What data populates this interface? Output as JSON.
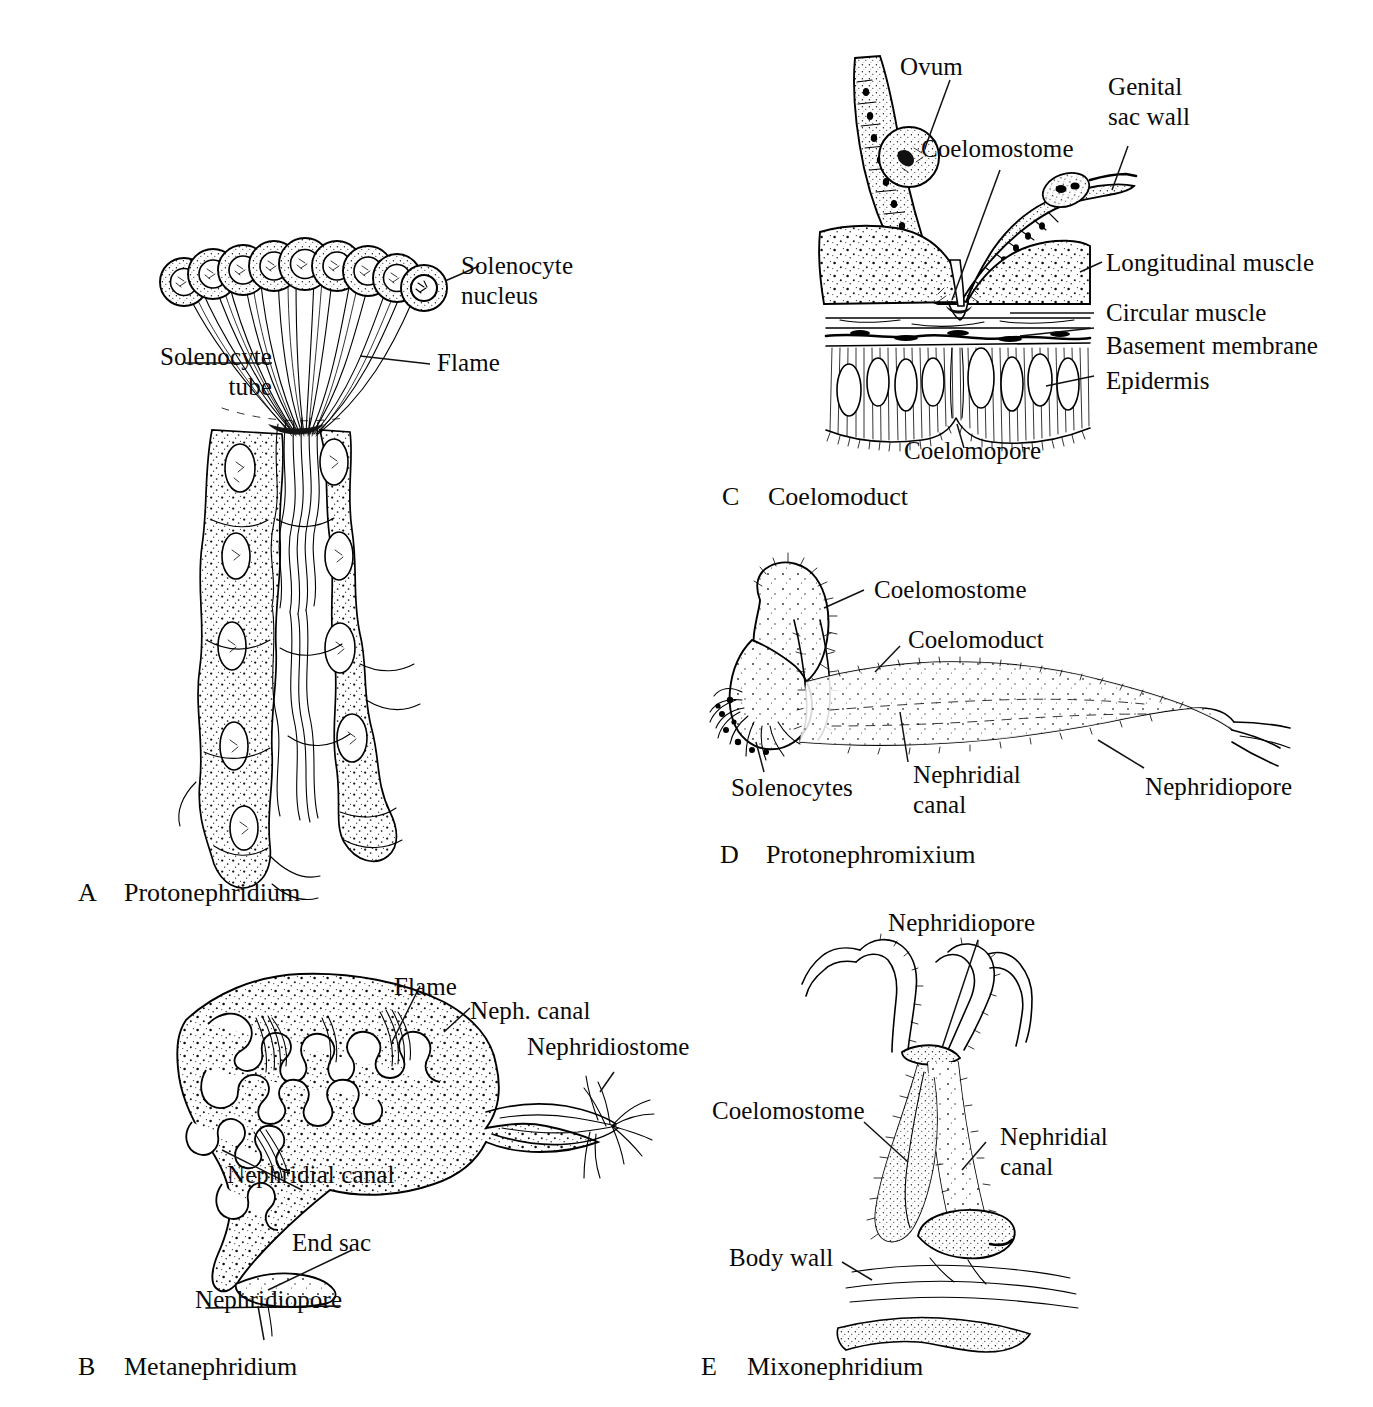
{
  "figure": {
    "background_color": "#ffffff",
    "ink_color": "#000000",
    "style": "black and white line drawing with stipple shading"
  },
  "panels": [
    {
      "id": "A",
      "letter": "A",
      "caption": "Protonephridium",
      "labels": [
        {
          "key": "solenocyte_nucleus",
          "text": "Solenocyte\nnucleus"
        },
        {
          "key": "solenocyte_tube",
          "text": "Solenocyte\ntube"
        },
        {
          "key": "flame",
          "text": "Flame"
        }
      ]
    },
    {
      "id": "B",
      "letter": "B",
      "caption": "Metanephridium",
      "labels": [
        {
          "key": "flame",
          "text": "Flame"
        },
        {
          "key": "neph_canal",
          "text": "Neph. canal"
        },
        {
          "key": "nephridiostome",
          "text": "Nephridiostome"
        },
        {
          "key": "nephridial_canal",
          "text": "Nephridial canal"
        },
        {
          "key": "end_sac",
          "text": "End sac"
        },
        {
          "key": "nephridiopore",
          "text": "Nephridiopore"
        }
      ]
    },
    {
      "id": "C",
      "letter": "C",
      "caption": "Coelomoduct",
      "labels": [
        {
          "key": "ovum",
          "text": "Ovum"
        },
        {
          "key": "coelomostome",
          "text": "Coelomostome"
        },
        {
          "key": "genital_sac_wall",
          "text": "Genital\nsac wall"
        },
        {
          "key": "longitudinal_muscle",
          "text": "Longitudinal muscle"
        },
        {
          "key": "circular_muscle",
          "text": "Circular muscle"
        },
        {
          "key": "basement_membrane",
          "text": "Basement membrane"
        },
        {
          "key": "epidermis",
          "text": "Epidermis"
        },
        {
          "key": "coelomopore",
          "text": "Coelomopore"
        }
      ]
    },
    {
      "id": "D",
      "letter": "D",
      "caption": "Protonephromixium",
      "labels": [
        {
          "key": "coelomostome",
          "text": "Coelomostome"
        },
        {
          "key": "coelomoduct",
          "text": "Coelomoduct"
        },
        {
          "key": "solenocytes",
          "text": "Solenocytes"
        },
        {
          "key": "nephridial_canal",
          "text": "Nephridial\ncanal"
        },
        {
          "key": "nephridiopore",
          "text": "Nephridiopore"
        }
      ]
    },
    {
      "id": "E",
      "letter": "E",
      "caption": "Mixonephridium",
      "labels": [
        {
          "key": "nephridiopore",
          "text": "Nephridiopore"
        },
        {
          "key": "coelomostome",
          "text": "Coelomostome"
        },
        {
          "key": "nephridial_canal",
          "text": "Nephridial\ncanal"
        },
        {
          "key": "body_wall",
          "text": "Body wall"
        }
      ]
    }
  ]
}
